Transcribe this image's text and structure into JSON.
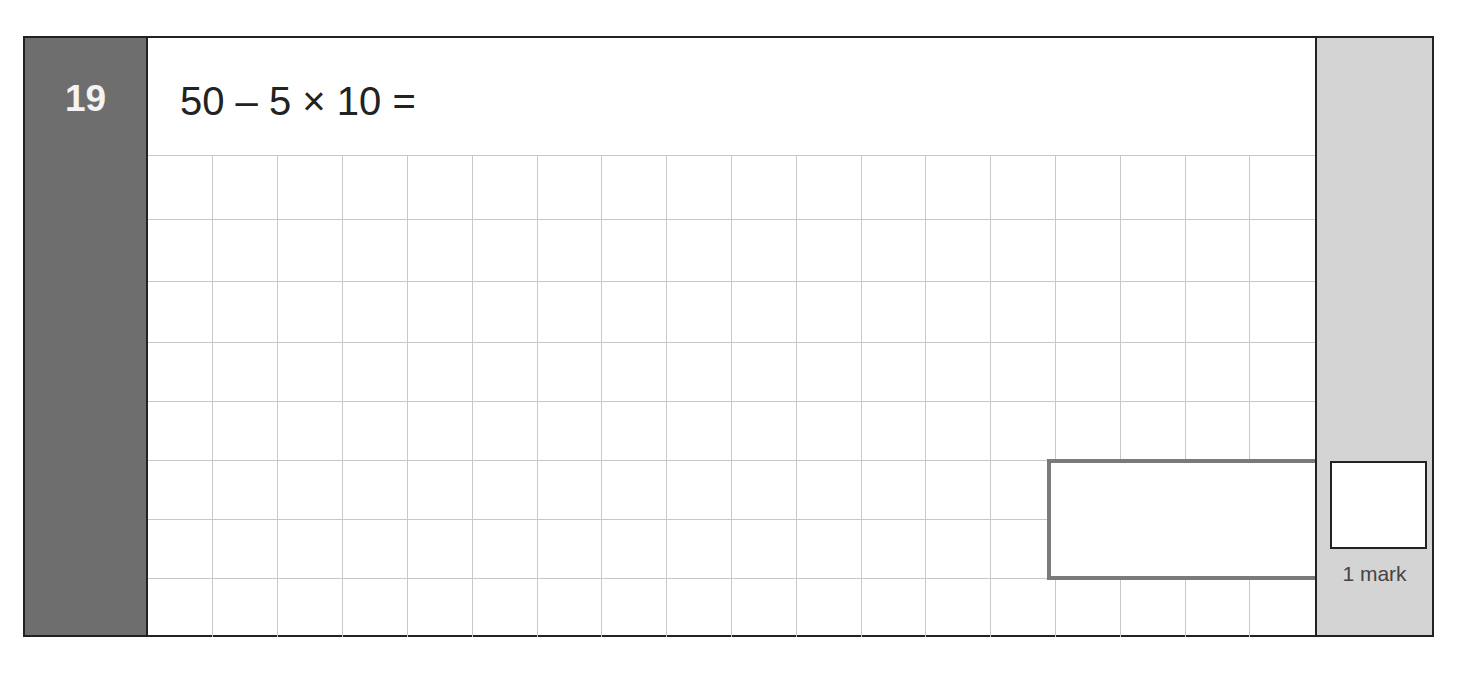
{
  "question": {
    "number": "19",
    "text": "50 – 5 × 10 ="
  },
  "working_grid": {
    "columns": 18,
    "rows": 8,
    "line_color": "#c8c8c8"
  },
  "answer_box": {
    "value": ""
  },
  "marks": {
    "label": "1 mark",
    "value": ""
  },
  "colors": {
    "number_column": "#6e6e6e",
    "mark_column": "#d4d4d4",
    "answer_box_border": "#7a7a7a",
    "frame": "#222222"
  }
}
